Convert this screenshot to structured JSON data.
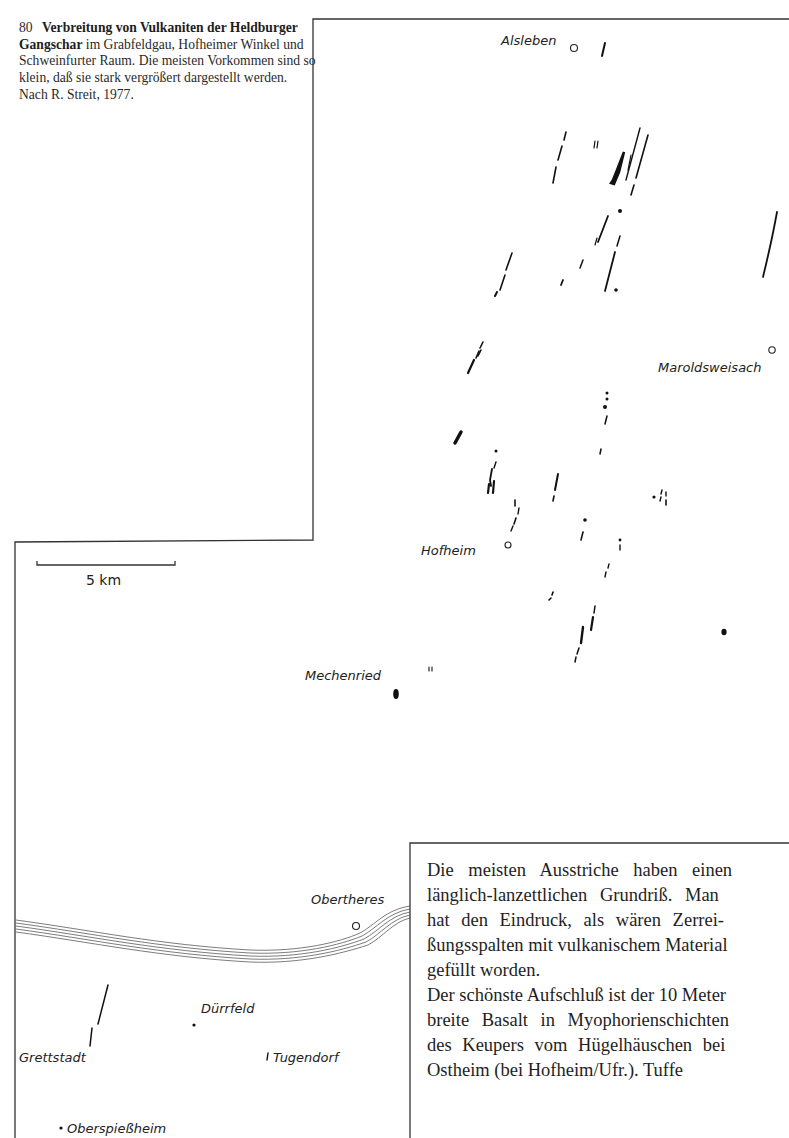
{
  "caption": {
    "figure_number": "80",
    "title_bold": "Verbreitung von Vulkaniten der Heldburger Gangschar",
    "body": "im Grabfeldgau, Hofheimer Winkel und Schweinfurter Raum. Die meisten Vorkommen sind so klein, daß sie stark vergrößert dargestellt werden. Nach R. Streit, 1977."
  },
  "map": {
    "scale_bar_label": "5 km",
    "places": {
      "alsleben": "Alsleben",
      "maroldsweisach": "Maroldsweisach",
      "hofheim": "Hofheim",
      "mechenried": "Mechenried",
      "obertheres": "Obertheres",
      "duerrfeld": "Dürrfeld",
      "grettstadt": "Grettstadt",
      "tugendorf": "Tugendorf",
      "oberspiessheim": "Oberspießheim"
    },
    "line_color": "#1a1a1a"
  },
  "text_box": {
    "lines": [
      "Die meisten Ausstriche haben einen",
      "länglich-lanzettlichen Grundriß. Man",
      "hat den Eindruck, als wären Zerrei-",
      "ßungsspalten mit vulkanischem Material",
      "gefüllt worden.",
      "Der schönste Aufschluß ist der 10 Meter",
      "breite Basalt in Myophorienschichten",
      "des Keupers vom Hügelhäuschen bei",
      "Ostheim (bei Hofheim/Ufr.). Tuffe"
    ]
  }
}
